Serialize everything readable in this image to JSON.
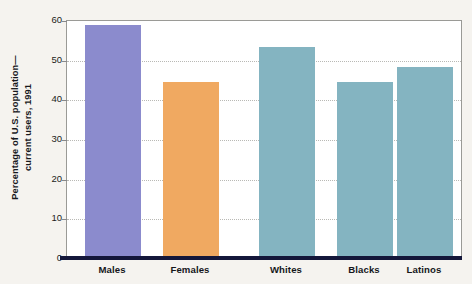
{
  "chart_data": {
    "type": "bar",
    "title": "",
    "subtitle": "",
    "xlabel": "",
    "ylabel_line1": "Percentage of U.S. population—",
    "ylabel_line2": "current users, 1991",
    "categories": [
      "Males",
      "Females",
      "Whites",
      "Blacks",
      "Latinos"
    ],
    "values": [
      59,
      44.5,
      53.5,
      44.5,
      48.5
    ],
    "series": [
      {
        "name": "Percentage of U.S. population—current users, 1991",
        "values": [
          59,
          44.5,
          53.5,
          44.5,
          48.5
        ]
      }
    ],
    "bar_colors": [
      "#8b8bcd",
      "#f0a961",
      "#84b4c1",
      "#84b4c1",
      "#84b4c1"
    ],
    "groups": [
      {
        "name": "Sex",
        "categories": [
          "Males",
          "Females"
        ]
      },
      {
        "name": "Race/Ethnicity",
        "categories": [
          "Whites",
          "Blacks",
          "Latinos"
        ]
      }
    ],
    "ylim": [
      0,
      60
    ],
    "yticks": [
      0,
      10,
      20,
      30,
      40,
      50,
      60
    ],
    "ytick_labels": [
      "0",
      "10",
      "20",
      "30",
      "40",
      "50",
      "60"
    ],
    "grid": true,
    "grid_axis": "y",
    "grid_style": "dotted",
    "legend": false,
    "legend_position": "none",
    "annotations": []
  },
  "style": {
    "background": "#f5f3ef",
    "plot_background": "#ffffff",
    "frame_color": "#9a9a96",
    "baseline_color": "#14173a",
    "gridline_color": "#b9b9b5",
    "text_color": "#16171b"
  }
}
